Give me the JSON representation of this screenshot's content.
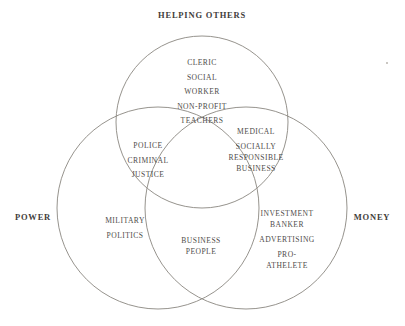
{
  "diagram": {
    "type": "venn3",
    "title_top": "HELPING OTHERS",
    "label_left": "POWER",
    "label_right": "MONEY",
    "stroke_color": "#8a8780",
    "text_color": "#4f4d4a",
    "background": "#ffffff",
    "sets": [
      {
        "id": "helping-others",
        "label": "HELPING OTHERS",
        "position": "top"
      },
      {
        "id": "power",
        "label": "POWER",
        "position": "left"
      },
      {
        "id": "money",
        "label": "MONEY",
        "position": "right"
      }
    ],
    "regions": {
      "top_only": {
        "name": "helping-others-only",
        "items": [
          "CLERIC",
          "SOCIAL",
          "WORKER",
          "NON-PROFIT",
          "TEACHERS"
        ]
      },
      "top_left": {
        "name": "helping-others-and-power",
        "items": [
          "POLICE",
          "CRIMINAL",
          "JUSTICE"
        ]
      },
      "top_right": {
        "name": "helping-others-and-money",
        "items": [
          "MEDICAL",
          "SOCIALLY",
          "RESPONSIBLE",
          "BUSINESS"
        ]
      },
      "left_only": {
        "name": "power-only",
        "items": [
          "MILITARY",
          "POLITICS"
        ]
      },
      "center": {
        "name": "all-three",
        "items": [
          "BUSINESS",
          "PEOPLE"
        ]
      },
      "right_only": {
        "name": "money-only",
        "items": [
          "INVESTMENT",
          "BANKER",
          "ADVERTISING",
          "PRO-",
          "ATHELETE"
        ]
      }
    }
  }
}
